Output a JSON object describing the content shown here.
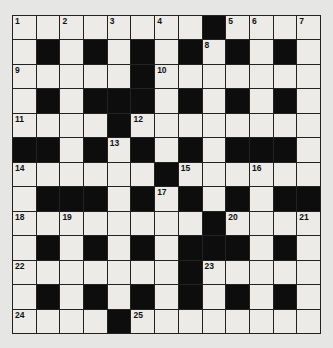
{
  "puzzle": {
    "rows": 13,
    "cols": 13,
    "colors": {
      "background": "#e6e6e4",
      "white_cell": "#ecebe8",
      "black_cell": "#0d0d0d",
      "grid_line": "#222222"
    },
    "layout": [
      "########.####",
      "#.#.#.#.#.#.#",
      "#####.#######",
      "#.#...#.#.#.#",
      "####.########",
      "..#.#.#.#...#",
      "######.######",
      "#...#.#.#.#..",
      "########.####",
      "#.#.#.#...#.#",
      "#######.#####",
      "#.#.#.#.#.#.#",
      "####.########"
    ],
    "numbers": [
      {
        "r": 0,
        "c": 0,
        "n": "1"
      },
      {
        "r": 0,
        "c": 2,
        "n": "2"
      },
      {
        "r": 0,
        "c": 4,
        "n": "3"
      },
      {
        "r": 0,
        "c": 6,
        "n": "4"
      },
      {
        "r": 0,
        "c": 9,
        "n": "5"
      },
      {
        "r": 0,
        "c": 10,
        "n": "6"
      },
      {
        "r": 0,
        "c": 12,
        "n": "7"
      },
      {
        "r": 1,
        "c": 8,
        "n": "8"
      },
      {
        "r": 2,
        "c": 0,
        "n": "9"
      },
      {
        "r": 2,
        "c": 6,
        "n": "10"
      },
      {
        "r": 4,
        "c": 0,
        "n": "11"
      },
      {
        "r": 4,
        "c": 5,
        "n": "12"
      },
      {
        "r": 5,
        "c": 4,
        "n": "13"
      },
      {
        "r": 6,
        "c": 0,
        "n": "14"
      },
      {
        "r": 6,
        "c": 7,
        "n": "15"
      },
      {
        "r": 6,
        "c": 10,
        "n": "16"
      },
      {
        "r": 7,
        "c": 6,
        "n": "17"
      },
      {
        "r": 8,
        "c": 0,
        "n": "18"
      },
      {
        "r": 8,
        "c": 2,
        "n": "19"
      },
      {
        "r": 8,
        "c": 9,
        "n": "20"
      },
      {
        "r": 8,
        "c": 12,
        "n": "21"
      },
      {
        "r": 10,
        "c": 0,
        "n": "22"
      },
      {
        "r": 10,
        "c": 8,
        "n": "23"
      },
      {
        "r": 12,
        "c": 0,
        "n": "24"
      },
      {
        "r": 12,
        "c": 5,
        "n": "25"
      }
    ]
  }
}
